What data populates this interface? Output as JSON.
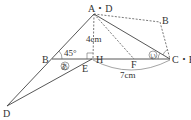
{
  "diagram": {
    "points": {
      "AD": "A・D",
      "B_right": "B",
      "B_left": "B",
      "H": "H",
      "E": "E",
      "F": "F",
      "CE": "C・E",
      "D": "D"
    },
    "measures": {
      "height": "4cm",
      "base": "7cm",
      "angle": "45°"
    },
    "angle_marks": {
      "a": "あ",
      "i": "い"
    }
  }
}
